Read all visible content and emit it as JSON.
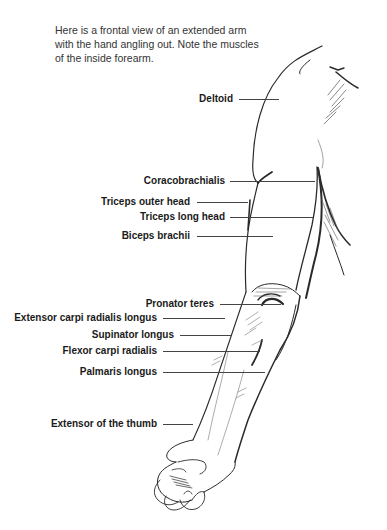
{
  "caption": "Here is a frontal view of an extended arm with the hand angling out. Note the muscles of the inside forearm.",
  "labels": [
    {
      "text": "Deltoid",
      "right": 233,
      "y": 99,
      "line_start": 239,
      "line_end": 279
    },
    {
      "text": "Coracobrachialis",
      "right": 225,
      "y": 181,
      "line_start": 230,
      "line_end": 315
    },
    {
      "text": "Triceps outer head",
      "right": 190,
      "y": 202,
      "line_start": 197,
      "line_end": 248
    },
    {
      "text": "Triceps long head",
      "right": 225,
      "y": 217,
      "line_start": 230,
      "line_end": 313
    },
    {
      "text": "Biceps brachii",
      "right": 190,
      "y": 236,
      "line_start": 197,
      "line_end": 273
    },
    {
      "text": "Pronator teres",
      "right": 214,
      "y": 304,
      "line_start": 220,
      "line_end": 281
    },
    {
      "text": "Extensor carpi radialis longus",
      "right": 157,
      "y": 318,
      "line_start": 163,
      "line_end": 225
    },
    {
      "text": "Supinator longus",
      "right": 174,
      "y": 335,
      "line_start": 180,
      "line_end": 231
    },
    {
      "text": "Flexor carpi radialis",
      "right": 157,
      "y": 351,
      "line_start": 163,
      "line_end": 260
    },
    {
      "text": "Palmaris longus",
      "right": 157,
      "y": 372,
      "line_start": 163,
      "line_end": 265
    },
    {
      "text": "Extensor of the thumb",
      "right": 157,
      "y": 424,
      "line_start": 163,
      "line_end": 193
    }
  ]
}
